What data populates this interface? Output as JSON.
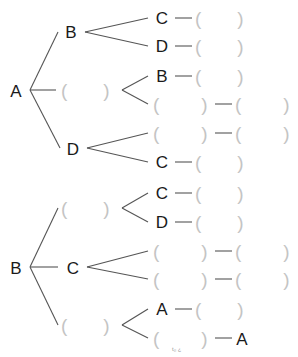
{
  "diagram": {
    "type": "tree",
    "trees": [
      {
        "root": "A",
        "branches": [
          {
            "label": "B",
            "children": [
              {
                "label": "C",
                "next": "( )"
              },
              {
                "label": "D",
                "next": "( )"
              }
            ]
          },
          {
            "label": "( )",
            "children": [
              {
                "label": "B",
                "next": "( )"
              },
              {
                "label": "( )",
                "next": "( )"
              }
            ]
          },
          {
            "label": "D",
            "children": [
              {
                "label": "( )",
                "next": "( )"
              },
              {
                "label": "C",
                "next": "( )"
              }
            ]
          }
        ]
      },
      {
        "root": "B",
        "branches": [
          {
            "label": "( )",
            "children": [
              {
                "label": "C",
                "next": "( )"
              },
              {
                "label": "D",
                "next": "( )"
              }
            ]
          },
          {
            "label": "C",
            "children": [
              {
                "label": "( )",
                "next": "( )"
              },
              {
                "label": "( )",
                "next": "( )"
              }
            ]
          },
          {
            "label": "( )",
            "children": [
              {
                "label": "A",
                "next": "( )"
              },
              {
                "label": "( )",
                "next": "A"
              }
            ]
          }
        ]
      }
    ]
  },
  "labels": {
    "t1_root": "A",
    "t1_b1": "B",
    "t1_b3": "D",
    "t1_b1_c1": "C",
    "t1_b1_c2": "D",
    "t1_b2_c1": "B",
    "t1_b3_c2": "C",
    "t2_root": "B",
    "t2_b2": "C",
    "t2_b1_c1": "C",
    "t2_b1_c2": "D",
    "t2_b3_c1": "A",
    "t2_b3_c2_next": "A"
  },
  "blank": {
    "open": "(",
    "close": ")"
  },
  "watermark": "t₀ ¿"
}
